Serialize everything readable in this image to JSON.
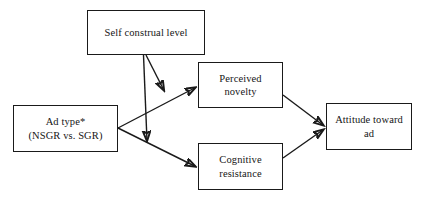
{
  "figure": {
    "type": "conceptual-model-diagram",
    "background_color": "#ffffff",
    "stroke_color": "#1a1a1a",
    "text_color": "#161616"
  },
  "nodes": {
    "self_construal": {
      "id": "self-construal-level",
      "label": "Self construal level",
      "line1": "Self construal level",
      "role": "moderator",
      "x": 87,
      "y": 10,
      "w": 118,
      "h": 45
    },
    "ad_type": {
      "id": "ad-type",
      "label": "Ad type* (NSGR vs. SGR)",
      "line1": "Ad type*",
      "line2": "(NSGR vs. SGR)",
      "role": "independent-variable",
      "x": 13,
      "y": 105,
      "w": 105,
      "h": 47
    },
    "perceived_novelty": {
      "id": "perceived-novelty",
      "label": "Perceived novelty",
      "line1": "Perceived",
      "line2": "novelty",
      "role": "mediator",
      "x": 198,
      "y": 62,
      "w": 85,
      "h": 46
    },
    "cognitive_resistance": {
      "id": "cognitive-resistance",
      "label": "Cognitive resistance",
      "line1": "Cognitive",
      "line2": "resistance",
      "role": "mediator",
      "x": 198,
      "y": 143,
      "w": 85,
      "h": 47
    },
    "attitude_toward_ad": {
      "id": "attitude-toward-ad",
      "label": "Attitude toward ad",
      "line1": "Attitude toward",
      "line2": "ad",
      "role": "dependent-variable",
      "x": 326,
      "y": 103,
      "w": 86,
      "h": 47
    }
  },
  "edges": [
    {
      "id": "ad-type-to-perceived-novelty",
      "from": "ad_type",
      "to": "perceived_novelty",
      "arrowhead": true,
      "points": "118,128 196,87"
    },
    {
      "id": "ad-type-to-cognitive-resistance",
      "from": "ad_type",
      "to": "cognitive_resistance",
      "arrowhead": true,
      "points": "118,128 196,167"
    },
    {
      "id": "perceived-novelty-to-attitude",
      "from": "perceived_novelty",
      "to": "attitude_toward_ad",
      "arrowhead": true,
      "points": "283,95 324,126"
    },
    {
      "id": "cognitive-resistance-to-attitude",
      "from": "cognitive_resistance",
      "to": "attitude_toward_ad",
      "arrowhead": true,
      "points": "283,158 324,129"
    },
    {
      "id": "self-construal-moderates-novelty-path",
      "from": "self_construal",
      "to": "ad-type-to-perceived-novelty",
      "arrowhead": true,
      "points": "146,55 164,91"
    },
    {
      "id": "self-construal-moderates-resistance-path",
      "from": "self_construal",
      "to": "ad-type-to-cognitive-resistance",
      "arrowhead": true,
      "points": "144,55 147,142"
    }
  ],
  "notes": {
    "asterisk_marker": "*"
  }
}
